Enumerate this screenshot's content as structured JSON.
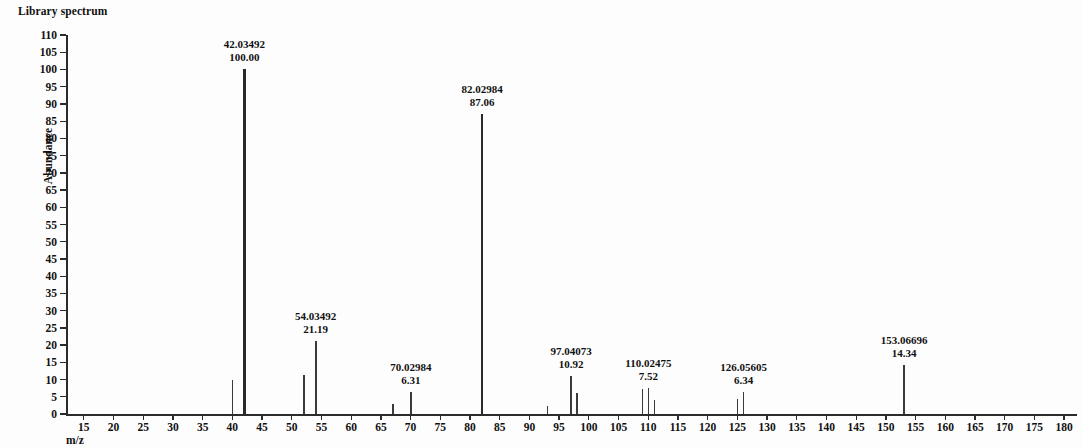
{
  "title": "Library spectrum",
  "axes": {
    "y_label": "Abundance",
    "x_label": "m/z",
    "y_ticks": [
      0,
      5,
      10,
      15,
      20,
      25,
      30,
      35,
      40,
      45,
      50,
      55,
      60,
      65,
      70,
      75,
      80,
      85,
      90,
      95,
      100,
      105,
      110
    ],
    "x_ticks": [
      15,
      20,
      25,
      30,
      35,
      40,
      45,
      50,
      55,
      60,
      65,
      70,
      75,
      80,
      85,
      90,
      95,
      100,
      105,
      110,
      115,
      120,
      125,
      130,
      135,
      140,
      145,
      150,
      155,
      160,
      165,
      170,
      175,
      180
    ]
  },
  "colors": {
    "peak": "#3a3a3a",
    "axis": "#2b2b2b",
    "text": "#111111",
    "background": "#fdfdfd"
  },
  "chart_data": {
    "type": "bar",
    "title": "Library spectrum",
    "xlabel": "m/z",
    "ylabel": "Abundance",
    "xlim": [
      12,
      182
    ],
    "ylim": [
      0,
      110
    ],
    "grid": false,
    "legend": "none",
    "categories": [
      40.0,
      42.03492,
      52.02,
      54.03492,
      67.02,
      70.02984,
      82.02984,
      93.03,
      97.04073,
      98.04,
      109.02,
      110.02475,
      111.03,
      125.05,
      126.05605,
      153.06696
    ],
    "values": [
      9.8,
      100.0,
      11.2,
      21.19,
      3.0,
      6.31,
      87.06,
      2.2,
      10.92,
      6.2,
      7.4,
      7.52,
      4.1,
      4.3,
      6.34,
      14.34
    ],
    "peaks": [
      {
        "mz": 40.0,
        "abundance": 9.8,
        "labeled": false
      },
      {
        "mz": 42.03492,
        "abundance": 100.0,
        "labeled": true,
        "mz_text": "42.03492",
        "ab_text": "100.00"
      },
      {
        "mz": 52.02,
        "abundance": 11.2,
        "labeled": false
      },
      {
        "mz": 54.03492,
        "abundance": 21.19,
        "labeled": true,
        "mz_text": "54.03492",
        "ab_text": "21.19"
      },
      {
        "mz": 67.02,
        "abundance": 3.0,
        "labeled": false
      },
      {
        "mz": 70.02984,
        "abundance": 6.31,
        "labeled": true,
        "mz_text": "70.02984",
        "ab_text": "6.31"
      },
      {
        "mz": 82.02984,
        "abundance": 87.06,
        "labeled": true,
        "mz_text": "82.02984",
        "ab_text": "87.06"
      },
      {
        "mz": 93.03,
        "abundance": 2.2,
        "labeled": false
      },
      {
        "mz": 97.04073,
        "abundance": 10.92,
        "labeled": true,
        "mz_text": "97.04073",
        "ab_text": "10.92"
      },
      {
        "mz": 98.04,
        "abundance": 6.2,
        "labeled": false
      },
      {
        "mz": 109.02,
        "abundance": 7.4,
        "labeled": false
      },
      {
        "mz": 110.02475,
        "abundance": 7.52,
        "labeled": true,
        "mz_text": "110.02475",
        "ab_text": "7.52"
      },
      {
        "mz": 111.03,
        "abundance": 4.1,
        "labeled": false
      },
      {
        "mz": 125.05,
        "abundance": 4.3,
        "labeled": false
      },
      {
        "mz": 126.05605,
        "abundance": 6.34,
        "labeled": true,
        "mz_text": "126.05605",
        "ab_text": "6.34"
      },
      {
        "mz": 153.06696,
        "abundance": 14.34,
        "labeled": true,
        "mz_text": "153.06696",
        "ab_text": "14.34"
      }
    ],
    "label_offsets": {
      "42.03492": 0,
      "54.03492": 0,
      "70.02984": 0,
      "82.02984": 0,
      "97.04073": 0,
      "110.02475": 0,
      "126.05605": 0,
      "153.06696": 0
    }
  }
}
